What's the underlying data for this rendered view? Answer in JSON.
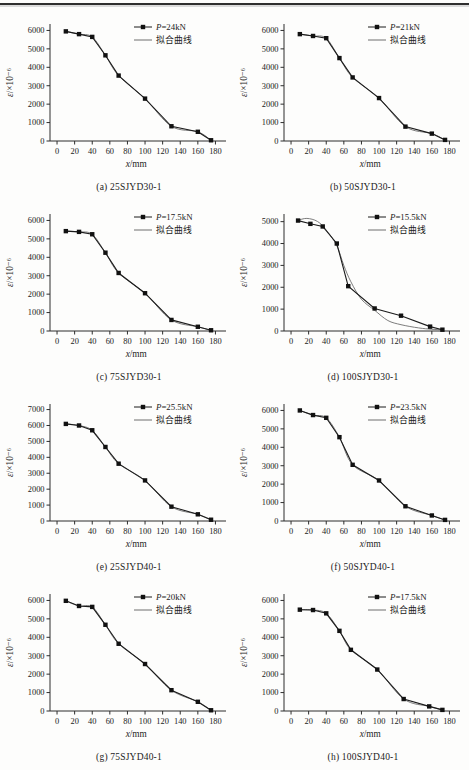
{
  "page": {
    "kind": "book-figure-page",
    "header_rule_color": "#2f2f2f",
    "background": "#fdfdfc"
  },
  "colors": {
    "data_line": "#1b1b1b",
    "fit_line": "#6e6e6e",
    "axis": "#2d2d2d",
    "text": "#1b1b1b",
    "marker": "#111111"
  },
  "chart_data": [
    {
      "type": "line",
      "caption": "(a) 25SJYD30-1",
      "xlabel": "x/mm",
      "ylabel": "ε/×10⁻⁶",
      "legend": [
        {
          "label": "P=24kN",
          "marker": "square-line"
        },
        {
          "label": "拟合曲线",
          "marker": "line"
        }
      ],
      "xlim": [
        -8,
        192
      ],
      "xticks": [
        0,
        20,
        40,
        60,
        80,
        100,
        120,
        140,
        160,
        180
      ],
      "yticks": [
        0,
        1000,
        2000,
        3000,
        4000,
        5000,
        6000
      ],
      "series": {
        "name": "P=24kN",
        "points": [
          [
            10,
            5950
          ],
          [
            25,
            5800
          ],
          [
            40,
            5650
          ],
          [
            55,
            4650
          ],
          [
            70,
            3550
          ],
          [
            100,
            2300
          ],
          [
            130,
            800
          ],
          [
            160,
            500
          ],
          [
            175,
            40
          ]
        ]
      },
      "fit_points": null
    },
    {
      "type": "line",
      "caption": "(b) 50SJYD30-1",
      "xlabel": "x/mm",
      "ylabel": "ε/×10⁻⁶",
      "legend": [
        {
          "label": "P=21kN",
          "marker": "square-line"
        },
        {
          "label": "拟合曲线",
          "marker": "line"
        }
      ],
      "xlim": [
        -8,
        192
      ],
      "xticks": [
        0,
        20,
        40,
        60,
        80,
        100,
        120,
        140,
        160,
        180
      ],
      "yticks": [
        0,
        1000,
        2000,
        3000,
        4000,
        5000,
        6000
      ],
      "series": {
        "name": "P=21kN",
        "points": [
          [
            10,
            5800
          ],
          [
            25,
            5700
          ],
          [
            40,
            5580
          ],
          [
            55,
            4500
          ],
          [
            70,
            3450
          ],
          [
            100,
            2330
          ],
          [
            130,
            780
          ],
          [
            160,
            400
          ],
          [
            175,
            60
          ]
        ]
      },
      "fit_points": null
    },
    {
      "type": "line",
      "caption": "(c) 75SJYD30-1",
      "xlabel": "x/mm",
      "ylabel": "ε/×10⁻⁶",
      "legend": [
        {
          "label": "P=17.5kN",
          "marker": "square-line"
        },
        {
          "label": "拟合曲线",
          "marker": "line"
        }
      ],
      "xlim": [
        -8,
        192
      ],
      "xticks": [
        0,
        20,
        40,
        60,
        80,
        100,
        120,
        140,
        160,
        180
      ],
      "yticks": [
        0,
        1000,
        2000,
        3000,
        4000,
        5000,
        6000
      ],
      "series": {
        "name": "P=17.5kN",
        "points": [
          [
            10,
            5420
          ],
          [
            25,
            5380
          ],
          [
            40,
            5250
          ],
          [
            55,
            4250
          ],
          [
            70,
            3150
          ],
          [
            100,
            2050
          ],
          [
            130,
            600
          ],
          [
            160,
            230
          ],
          [
            175,
            40
          ]
        ]
      },
      "fit_points": null
    },
    {
      "type": "line",
      "caption": "(d) 100SJYD30-1",
      "xlabel": "x/mm",
      "ylabel": "ε/×10⁻⁶",
      "legend": [
        {
          "label": "P=15.5kN",
          "marker": "square-line"
        },
        {
          "label": "拟合曲线",
          "marker": "line"
        }
      ],
      "xlim": [
        -8,
        192
      ],
      "xticks": [
        0,
        20,
        40,
        60,
        80,
        100,
        120,
        140,
        160,
        180
      ],
      "yticks": [
        0,
        1000,
        2000,
        3000,
        4000,
        5000
      ],
      "series": {
        "name": "P=15.5kN",
        "points": [
          [
            8,
            5050
          ],
          [
            22,
            4900
          ],
          [
            36,
            4780
          ],
          [
            52,
            4000
          ],
          [
            65,
            2050
          ],
          [
            95,
            1030
          ],
          [
            125,
            700
          ],
          [
            158,
            200
          ],
          [
            172,
            60
          ]
        ]
      },
      "fit_points": [
        [
          8,
          5060
        ],
        [
          18,
          5150
        ],
        [
          30,
          5010
        ],
        [
          40,
          4620
        ],
        [
          52,
          3900
        ],
        [
          60,
          3000
        ],
        [
          68,
          2250
        ],
        [
          80,
          1450
        ],
        [
          95,
          950
        ],
        [
          110,
          480
        ],
        [
          125,
          290
        ],
        [
          145,
          140
        ],
        [
          160,
          80
        ],
        [
          172,
          55
        ]
      ]
    },
    {
      "type": "line",
      "caption": "(e) 25SJYD40-1",
      "xlabel": "x/mm",
      "ylabel": "ε/×10⁻⁶",
      "legend": [
        {
          "label": "P=25.5kN",
          "marker": "square-line"
        },
        {
          "label": "拟合曲线",
          "marker": "line"
        }
      ],
      "xlim": [
        -8,
        192
      ],
      "xticks": [
        0,
        20,
        40,
        60,
        80,
        100,
        120,
        140,
        160,
        180
      ],
      "yticks": [
        0,
        1000,
        2000,
        3000,
        4000,
        5000,
        6000,
        7000
      ],
      "series": {
        "name": "P=25.5kN",
        "points": [
          [
            10,
            6100
          ],
          [
            25,
            6000
          ],
          [
            40,
            5700
          ],
          [
            55,
            4650
          ],
          [
            70,
            3600
          ],
          [
            100,
            2550
          ],
          [
            130,
            900
          ],
          [
            160,
            420
          ],
          [
            175,
            80
          ]
        ]
      },
      "fit_points": null
    },
    {
      "type": "line",
      "caption": "(f) 50SJYD40-1",
      "xlabel": "x/mm",
      "ylabel": "ε/×10⁻⁶",
      "legend": [
        {
          "label": "P=23.5kN",
          "marker": "square-line"
        },
        {
          "label": "拟合曲线",
          "marker": "line"
        }
      ],
      "xlim": [
        -8,
        192
      ],
      "xticks": [
        0,
        20,
        40,
        60,
        80,
        100,
        120,
        140,
        160,
        180
      ],
      "yticks": [
        0,
        1000,
        2000,
        3000,
        4000,
        5000,
        6000
      ],
      "series": {
        "name": "P=23.5kN",
        "points": [
          [
            10,
            6000
          ],
          [
            25,
            5750
          ],
          [
            40,
            5600
          ],
          [
            55,
            4550
          ],
          [
            70,
            3050
          ],
          [
            100,
            2200
          ],
          [
            130,
            800
          ],
          [
            160,
            300
          ],
          [
            175,
            60
          ]
        ]
      },
      "fit_points": null
    },
    {
      "type": "line",
      "caption": "(g) 75SJYD40-1",
      "xlabel": "x/mm",
      "ylabel": "ε/×10⁻⁶",
      "legend": [
        {
          "label": "P=20kN",
          "marker": "square-line"
        },
        {
          "label": "拟合曲线",
          "marker": "line"
        }
      ],
      "xlim": [
        -8,
        192
      ],
      "xticks": [
        0,
        20,
        40,
        60,
        80,
        100,
        120,
        140,
        160,
        180
      ],
      "yticks": [
        0,
        1000,
        2000,
        3000,
        4000,
        5000,
        6000
      ],
      "series": {
        "name": "P=20kN",
        "points": [
          [
            10,
            5980
          ],
          [
            25,
            5700
          ],
          [
            40,
            5650
          ],
          [
            55,
            4680
          ],
          [
            70,
            3650
          ],
          [
            100,
            2550
          ],
          [
            130,
            1130
          ],
          [
            160,
            500
          ],
          [
            175,
            40
          ]
        ]
      },
      "fit_points": null
    },
    {
      "type": "line",
      "caption": "(h) 100SJYD40-1",
      "xlabel": "x/mm",
      "ylabel": "ε/×10⁻⁶",
      "legend": [
        {
          "label": "P=17.5kN",
          "marker": "square-line"
        },
        {
          "label": "拟合曲线",
          "marker": "line"
        }
      ],
      "xlim": [
        -8,
        192
      ],
      "xticks": [
        0,
        20,
        40,
        60,
        80,
        100,
        120,
        140,
        160,
        180
      ],
      "yticks": [
        0,
        1000,
        2000,
        3000,
        4000,
        5000,
        6000
      ],
      "series": {
        "name": "P=17.5kN",
        "points": [
          [
            10,
            5500
          ],
          [
            25,
            5480
          ],
          [
            40,
            5300
          ],
          [
            55,
            4350
          ],
          [
            68,
            3320
          ],
          [
            98,
            2250
          ],
          [
            128,
            650
          ],
          [
            157,
            250
          ],
          [
            172,
            60
          ]
        ]
      },
      "fit_points": null
    }
  ]
}
